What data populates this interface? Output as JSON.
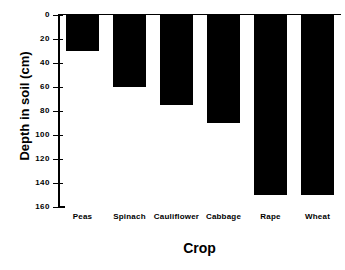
{
  "chart_data": {
    "type": "bar",
    "title": "",
    "xlabel": "Crop",
    "ylabel": "Depth in soil (cm)",
    "categories": [
      "Peas",
      "Spinach",
      "Cauliflower",
      "Cabbage",
      "Rape",
      "Wheat"
    ],
    "values": [
      30,
      60,
      75,
      90,
      150,
      150
    ],
    "ylim": [
      0,
      160
    ],
    "y_inverted": true,
    "yticks": [
      0,
      20,
      40,
      60,
      80,
      100,
      120,
      140,
      160
    ],
    "ytick_labels": [
      "0",
      "20",
      "40",
      "60",
      "80",
      "100",
      "120",
      "140",
      "160"
    ],
    "grid": false,
    "legend": null,
    "bar_color": "#000000",
    "axis_color": "#000000",
    "background": "#ffffff"
  }
}
